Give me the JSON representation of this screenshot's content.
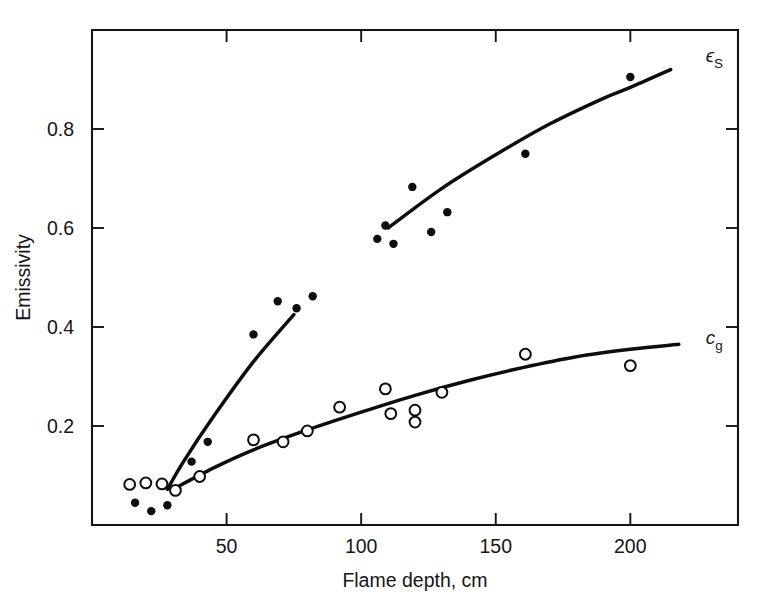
{
  "chart_data": {
    "type": "scatter",
    "title": "",
    "xlabel": "Flame depth, cm",
    "ylabel": "Emissivity",
    "xlim": [
      0,
      240
    ],
    "ylim": [
      0,
      1.0
    ],
    "xticks": [
      50,
      100,
      150,
      200
    ],
    "yticks": [
      0.2,
      0.4,
      0.6,
      0.8
    ],
    "xticklabels": [
      "50",
      "100",
      "150",
      "200"
    ],
    "yticklabels": [
      "0.2",
      "0.4",
      "0.6",
      "0.8"
    ],
    "grid": false,
    "legend_position": "inline-right-of-curve",
    "series": [
      {
        "name": "epsilon_S",
        "label_base": "ϵ",
        "label_sub": "S",
        "marker": "filled-circle",
        "label_x": 228,
        "label_y": 0.935,
        "points": [
          {
            "x": 16,
            "y": 0.045
          },
          {
            "x": 22,
            "y": 0.028
          },
          {
            "x": 28,
            "y": 0.04
          },
          {
            "x": 37,
            "y": 0.128
          },
          {
            "x": 43,
            "y": 0.168
          },
          {
            "x": 60,
            "y": 0.385
          },
          {
            "x": 69,
            "y": 0.452
          },
          {
            "x": 76,
            "y": 0.438
          },
          {
            "x": 82,
            "y": 0.462
          },
          {
            "x": 106,
            "y": 0.578
          },
          {
            "x": 109,
            "y": 0.605
          },
          {
            "x": 112,
            "y": 0.568
          },
          {
            "x": 119,
            "y": 0.683
          },
          {
            "x": 126,
            "y": 0.592
          },
          {
            "x": 132,
            "y": 0.632
          },
          {
            "x": 161,
            "y": 0.75
          },
          {
            "x": 200,
            "y": 0.905
          }
        ],
        "curve": [
          {
            "x": 28,
            "y": 0.072
          },
          {
            "x": 34,
            "y": 0.128
          },
          {
            "x": 45,
            "y": 0.218
          },
          {
            "x": 60,
            "y": 0.33
          },
          {
            "x": 75,
            "y": 0.425
          },
          {
            "x": 90,
            "y": 0.505
          },
          {
            "x": 110,
            "y": 0.6
          },
          {
            "x": 130,
            "y": 0.68
          },
          {
            "x": 150,
            "y": 0.748
          },
          {
            "x": 170,
            "y": 0.81
          },
          {
            "x": 190,
            "y": 0.862
          },
          {
            "x": 200,
            "y": 0.884
          },
          {
            "x": 215,
            "y": 0.92
          }
        ],
        "curve_break": {
          "x_start": 88,
          "x_end": 93
        }
      },
      {
        "name": "c_g",
        "label_base": "c",
        "label_sub": "g",
        "marker": "open-circle",
        "label_x": 228,
        "label_y": 0.365,
        "points": [
          {
            "x": 14,
            "y": 0.082
          },
          {
            "x": 20,
            "y": 0.085
          },
          {
            "x": 26,
            "y": 0.083
          },
          {
            "x": 31,
            "y": 0.07
          },
          {
            "x": 40,
            "y": 0.098
          },
          {
            "x": 60,
            "y": 0.172
          },
          {
            "x": 71,
            "y": 0.168
          },
          {
            "x": 80,
            "y": 0.19
          },
          {
            "x": 92,
            "y": 0.238
          },
          {
            "x": 109,
            "y": 0.275
          },
          {
            "x": 111,
            "y": 0.225
          },
          {
            "x": 120,
            "y": 0.232
          },
          {
            "x": 120,
            "y": 0.208
          },
          {
            "x": 130,
            "y": 0.268
          },
          {
            "x": 161,
            "y": 0.345
          },
          {
            "x": 200,
            "y": 0.322
          }
        ],
        "curve": [
          {
            "x": 30,
            "y": 0.072
          },
          {
            "x": 45,
            "y": 0.115
          },
          {
            "x": 60,
            "y": 0.152
          },
          {
            "x": 80,
            "y": 0.192
          },
          {
            "x": 100,
            "y": 0.228
          },
          {
            "x": 120,
            "y": 0.262
          },
          {
            "x": 140,
            "y": 0.292
          },
          {
            "x": 160,
            "y": 0.318
          },
          {
            "x": 180,
            "y": 0.34
          },
          {
            "x": 200,
            "y": 0.355
          },
          {
            "x": 218,
            "y": 0.365
          }
        ]
      }
    ]
  },
  "axes": {
    "x_axis_name": "Flame depth, cm",
    "y_axis_name": "Emissivity"
  }
}
